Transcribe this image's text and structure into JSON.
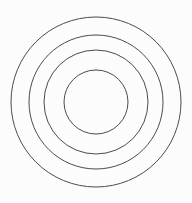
{
  "figure": {
    "background_color": "#fdfcfd",
    "stroke_color": "#4a4a50",
    "fill": "none",
    "stroke_width": 1,
    "width": 192,
    "height": 203
  },
  "chart_data": {
    "type": "scatter",
    "title": "",
    "subtitle": "",
    "xlabel": "",
    "ylabel": "",
    "xlim": [
      0,
      192
    ],
    "ylim": [
      0,
      203
    ],
    "grid": false,
    "legend": null,
    "annotations": [],
    "tick_labels": {
      "x": [],
      "y": []
    },
    "shape": "concentric-circles",
    "count": 4,
    "center": {
      "x": 96,
      "y": 102
    },
    "series": [
      {
        "name": "ring-1-outer",
        "cx": 96,
        "cy": 102,
        "r": 85,
        "stroke": "#4a4a50",
        "fill": "none",
        "extent_x": [
          13,
          181
        ],
        "extent_y": [
          17,
          188
        ]
      },
      {
        "name": "ring-2",
        "cx": 96,
        "cy": 102,
        "r": 67,
        "stroke": "#4a4a50",
        "fill": "none",
        "extent_x": [
          29,
          165
        ],
        "extent_y": [
          36,
          170
        ]
      },
      {
        "name": "ring-3",
        "cx": 96,
        "cy": 102,
        "r": 52,
        "stroke": "#4a4a50",
        "fill": "none",
        "extent_x": [
          44,
          148
        ],
        "extent_y": [
          51,
          154
        ]
      },
      {
        "name": "ring-4-inner",
        "cx": 96,
        "cy": 102,
        "r": 32,
        "stroke": "#4a4a50",
        "fill": "none",
        "extent_x": [
          64,
          127
        ],
        "extent_y": [
          70,
          134
        ]
      }
    ],
    "radii": [
      85,
      67,
      52,
      32
    ]
  }
}
